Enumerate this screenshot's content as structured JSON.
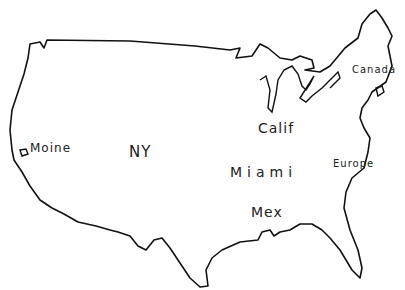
{
  "map": {
    "title": "Hand-drawn map of the United States",
    "outline_color": "#111111",
    "labels": [
      {
        "text": "Moine",
        "x": 30,
        "y": 141,
        "size": 12
      },
      {
        "text": "NY",
        "x": 129,
        "y": 143,
        "size": 15
      },
      {
        "text": "Calif",
        "x": 258,
        "y": 120,
        "size": 14
      },
      {
        "text": "Miami",
        "x": 230,
        "y": 164,
        "size": 14
      },
      {
        "text": "Mex",
        "x": 251,
        "y": 204,
        "size": 14
      },
      {
        "text": "Europe",
        "x": 333,
        "y": 158,
        "size": 10
      },
      {
        "text": "Canada",
        "x": 352,
        "y": 64,
        "size": 10
      }
    ]
  }
}
